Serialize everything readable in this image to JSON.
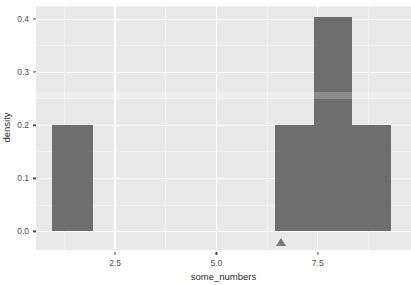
{
  "chart_data": {
    "type": "bar",
    "title": "",
    "xlabel": "some_numbers",
    "ylabel": "density",
    "xlim": [
      0.55,
      9.8
    ],
    "ylim": [
      -0.035,
      0.425
    ],
    "grid": true,
    "legend": null,
    "bar_color": "#6e6e6e",
    "panel_color": "#e9e9e9",
    "gridline_color": "#ffffff",
    "x_ticks": [
      2.5,
      5.0,
      7.5
    ],
    "x_tick_labels": [
      "2.5",
      "5.0",
      "7.5"
    ],
    "y_ticks": [
      0.0,
      0.1,
      0.2,
      0.3,
      0.4
    ],
    "y_tick_labels": [
      "0.0",
      "0.1",
      "0.2",
      "0.3",
      "0.4"
    ],
    "bins": [
      {
        "x_start": 0.95,
        "x_end": 1.95,
        "value": 0.2
      },
      {
        "x_start": 6.45,
        "x_end": 7.4,
        "value": 0.2
      },
      {
        "x_start": 7.4,
        "x_end": 8.35,
        "value": 0.405
      },
      {
        "x_start": 8.35,
        "x_end": 9.3,
        "value": 0.2
      }
    ],
    "categories": [
      "1.45",
      "6.95",
      "7.9",
      "8.85"
    ],
    "values": [
      0.2,
      0.2,
      0.405,
      0.2
    ],
    "annotations": [
      {
        "type": "triangle-marker",
        "x": 6.6,
        "y": -0.02,
        "color": "#7a7a7a"
      }
    ]
  },
  "artifacts": {
    "watermark_text": ""
  }
}
